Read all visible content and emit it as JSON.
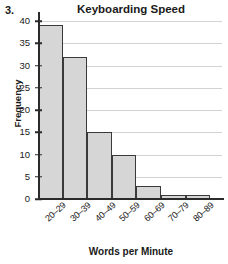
{
  "item_number": "3.",
  "chart_data": {
    "type": "bar",
    "title": "Keyboarding Speed",
    "xlabel": "Words per Minute",
    "ylabel": "Frequency",
    "categories": [
      "20–29",
      "30–39",
      "40–49",
      "50–59",
      "60–69",
      "70–79",
      "80–89"
    ],
    "values": [
      39,
      32,
      15,
      10,
      3,
      1,
      1
    ],
    "ylim": [
      0,
      40
    ],
    "ytick_labels": [
      "0",
      "5",
      "10",
      "15",
      "20",
      "25",
      "30",
      "35",
      "40"
    ],
    "ytick_values": [
      0,
      5,
      10,
      15,
      20,
      25,
      30,
      35,
      40
    ],
    "grid": "horizontal",
    "legend": "none",
    "bar_fill_color": "#d6d6d6",
    "bar_border_color": "#3a3a3a",
    "gridline_color": "#d2d2d2",
    "axis_color": "#2b2b2b"
  }
}
